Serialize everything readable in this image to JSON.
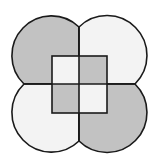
{
  "diagram": {
    "colors": {
      "dark_fill": "#c2c2c2",
      "light_fill": "#f3f3f3",
      "stroke": "#1a1a1a",
      "background": "#ffffff"
    },
    "lobes": [
      {
        "name": "top-left",
        "shade": "dark"
      },
      {
        "name": "top-right",
        "shade": "light"
      },
      {
        "name": "bottom-left",
        "shade": "light"
      },
      {
        "name": "bottom-right",
        "shade": "dark"
      }
    ],
    "inner_square": {
      "cells": [
        {
          "name": "top-left",
          "shade": "light"
        },
        {
          "name": "top-right",
          "shade": "dark"
        },
        {
          "name": "bottom-left",
          "shade": "dark"
        },
        {
          "name": "bottom-right",
          "shade": "light"
        }
      ]
    }
  }
}
